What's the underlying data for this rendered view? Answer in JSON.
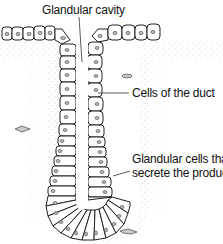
{
  "diagram": {
    "type": "biology-illustration",
    "labels": {
      "cavity": "Glandular cavity",
      "duct": "Cells of the duct",
      "secretory_line1": "Glandular cells that",
      "secretory_line2": "secrete the product"
    },
    "colors": {
      "outline": "#222222",
      "nucleus_fill": "#bbbbbb",
      "stipple": "#b0b0b0",
      "background": "#ffffff"
    }
  }
}
